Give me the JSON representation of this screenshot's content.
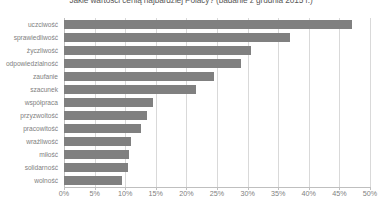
{
  "chart_data": {
    "type": "bar",
    "orientation": "horizontal",
    "title": "Jakie wartości cenią najbardziej Polacy? (badanie z grudnia 2015 r.)",
    "xlabel": "",
    "ylabel": "",
    "xlim": [
      0,
      50
    ],
    "xticks": [
      0,
      5,
      10,
      15,
      20,
      25,
      30,
      35,
      40,
      45,
      50
    ],
    "xtick_labels": [
      "0%",
      "5%",
      "10%",
      "15%",
      "20%",
      "25%",
      "30%",
      "35%",
      "40%",
      "45%",
      "50%"
    ],
    "grid": true,
    "grid_axis": "x",
    "legend": false,
    "bar_color": "#808080",
    "categories": [
      "uczciwość",
      "sprawiedliwość",
      "życzliwość",
      "odpowiedzialność",
      "zaufanie",
      "szacunek",
      "współpraca",
      "przyzwoitość",
      "pracowitość",
      "wrażliwość",
      "miłość",
      "solidarność",
      "wolność"
    ],
    "values": [
      47,
      37,
      30.5,
      29,
      24.5,
      21.5,
      14.5,
      13.5,
      12.5,
      11,
      10.7,
      10.4,
      9.5
    ]
  }
}
